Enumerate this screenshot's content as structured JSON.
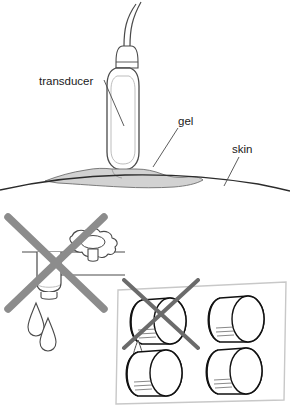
{
  "figure": {
    "title_visible": false,
    "panels": [
      {
        "id": "transducer-on-skin",
        "description": "Ultrasound transducer pressed against curved skin surface with coupling gel between",
        "labels": [
          {
            "key": "transducer",
            "text": "transducer"
          },
          {
            "key": "gel",
            "text": "gel"
          },
          {
            "key": "skin",
            "text": "skin"
          }
        ]
      },
      {
        "id": "bottle-dripping-on-shelf",
        "description": "Crossed-out gel bottle stored upside down on shelf dripping gel",
        "marker": "cross-out-x",
        "drips": 2
      },
      {
        "id": "bottles-in-box",
        "description": "Crossed-out gel bottle stored inverted in a storage box with four bottles",
        "marker": "cross-out-x",
        "bottles": 4,
        "drips": 2
      }
    ]
  },
  "labels": {
    "transducer": "transducer",
    "gel": "gel",
    "skin": "skin"
  },
  "colors": {
    "outline": "#4a4a4a",
    "gel_fill": "#d2d2d2",
    "gel_stroke": "#6e6e6e",
    "cross_out": "#8c8c8c",
    "box_border": "#c8c8c8",
    "bottle_dark": "#111111",
    "background": "#ffffff",
    "text": "#1a1a1a"
  }
}
